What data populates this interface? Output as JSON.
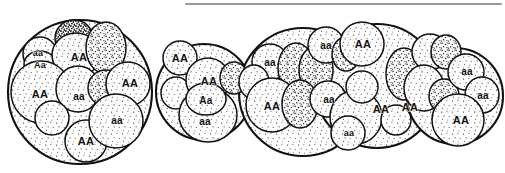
{
  "figure": {
    "background_color": "#ffffff",
    "ink_color": "#111111",
    "stipple_color": "#2a2a2a",
    "rule": {
      "name": "top-horizontal-rule",
      "color": "#9a9a9a",
      "x1": 186,
      "x2": 501,
      "y": 4,
      "thickness": 2
    },
    "populations": [
      {
        "id": "population-1",
        "cx": 80,
        "cy": 92,
        "r": 72,
        "fill": "light-stipple"
      },
      {
        "id": "population-2",
        "cx": 204,
        "cy": 92,
        "r": 48,
        "fill": "light-stipple"
      },
      {
        "id": "population-3",
        "cx": 303,
        "cy": 92,
        "r": 64,
        "fill": "light-stipple"
      },
      {
        "id": "population-4",
        "cx": 377,
        "cy": 86,
        "r": 62,
        "fill": "light-stipple"
      },
      {
        "id": "population-5",
        "cx": 455,
        "cy": 96,
        "r": 48,
        "fill": "light-stipple"
      }
    ],
    "cells": [
      {
        "id": "c1-1",
        "cx": 40,
        "cy": 54,
        "rx": 17,
        "ry": 17,
        "shade": "light"
      },
      {
        "id": "c1-2",
        "cx": 40,
        "cy": 64,
        "rx": 16,
        "ry": 13,
        "shade": "light"
      },
      {
        "id": "c1-3",
        "cx": 74,
        "cy": 38,
        "rx": 19,
        "ry": 18,
        "shade": "dark"
      },
      {
        "id": "c1-4",
        "cx": 76,
        "cy": 55,
        "rx": 24,
        "ry": 22,
        "shade": "light"
      },
      {
        "id": "c1-5",
        "cx": 106,
        "cy": 48,
        "rx": 20,
        "ry": 26,
        "shade": "medium"
      },
      {
        "id": "c1-6",
        "cx": 41,
        "cy": 92,
        "rx": 30,
        "ry": 31,
        "shade": "light"
      },
      {
        "id": "c1-7",
        "cx": 78,
        "cy": 89,
        "rx": 22,
        "ry": 23,
        "shade": "light"
      },
      {
        "id": "c1-8",
        "cx": 106,
        "cy": 88,
        "rx": 18,
        "ry": 18,
        "shade": "medium"
      },
      {
        "id": "c1-9",
        "cx": 128,
        "cy": 84,
        "rx": 22,
        "ry": 22,
        "shade": "light"
      },
      {
        "id": "c1-10",
        "cx": 52,
        "cy": 118,
        "rx": 17,
        "ry": 17,
        "shade": "light"
      },
      {
        "id": "c1-11",
        "cx": 86,
        "cy": 141,
        "rx": 21,
        "ry": 21,
        "shade": "light"
      },
      {
        "id": "c1-12",
        "cx": 116,
        "cy": 121,
        "rx": 27,
        "ry": 27,
        "shade": "light"
      },
      {
        "id": "c2-1",
        "cx": 180,
        "cy": 58,
        "rx": 17,
        "ry": 17,
        "shade": "light"
      },
      {
        "id": "c2-2",
        "cx": 176,
        "cy": 93,
        "rx": 15,
        "ry": 16,
        "shade": "light"
      },
      {
        "id": "c2-3",
        "cx": 208,
        "cy": 80,
        "rx": 22,
        "ry": 22,
        "shade": "light"
      },
      {
        "id": "c2-4",
        "cx": 234,
        "cy": 78,
        "rx": 14,
        "ry": 16,
        "shade": "medium"
      },
      {
        "id": "c2-5",
        "cx": 208,
        "cy": 115,
        "rx": 29,
        "ry": 27,
        "shade": "light"
      },
      {
        "id": "c2-6",
        "cx": 206,
        "cy": 99,
        "rx": 20,
        "ry": 16,
        "shade": "light"
      },
      {
        "id": "c3-1",
        "cx": 270,
        "cy": 62,
        "rx": 18,
        "ry": 18,
        "shade": "light"
      },
      {
        "id": "c3-2",
        "cx": 254,
        "cy": 82,
        "rx": 15,
        "ry": 17,
        "shade": "light"
      },
      {
        "id": "c3-3",
        "cx": 296,
        "cy": 68,
        "rx": 18,
        "ry": 25,
        "shade": "medium"
      },
      {
        "id": "c3-4",
        "cx": 316,
        "cy": 70,
        "rx": 17,
        "ry": 24,
        "shade": "medium"
      },
      {
        "id": "c3-5",
        "cx": 272,
        "cy": 105,
        "rx": 26,
        "ry": 27,
        "shade": "light"
      },
      {
        "id": "c3-6",
        "cx": 300,
        "cy": 104,
        "rx": 18,
        "ry": 24,
        "shade": "medium"
      },
      {
        "id": "c3-7",
        "cx": 328,
        "cy": 99,
        "rx": 18,
        "ry": 18,
        "shade": "light"
      },
      {
        "id": "c3-8",
        "cx": 326,
        "cy": 45,
        "rx": 18,
        "ry": 18,
        "shade": "light"
      },
      {
        "id": "c3-9",
        "cx": 346,
        "cy": 54,
        "rx": 14,
        "ry": 17,
        "shade": "medium"
      },
      {
        "id": "c3-10",
        "cx": 362,
        "cy": 44,
        "rx": 22,
        "ry": 22,
        "shade": "light"
      },
      {
        "id": "c3-11",
        "cx": 356,
        "cy": 117,
        "rx": 26,
        "ry": 27,
        "shade": "light"
      },
      {
        "id": "c3-12",
        "cx": 348,
        "cy": 133,
        "rx": 17,
        "ry": 17,
        "shade": "light"
      },
      {
        "id": "c3-13",
        "cx": 362,
        "cy": 87,
        "rx": 16,
        "ry": 16,
        "shade": "light"
      },
      {
        "id": "c4-1",
        "cx": 404,
        "cy": 74,
        "rx": 18,
        "ry": 26,
        "shade": "medium"
      },
      {
        "id": "c4-2",
        "cx": 396,
        "cy": 120,
        "rx": 15,
        "ry": 15,
        "shade": "light"
      },
      {
        "id": "c4-3",
        "cx": 430,
        "cy": 52,
        "rx": 18,
        "ry": 18,
        "shade": "light"
      },
      {
        "id": "c4-4",
        "cx": 446,
        "cy": 52,
        "rx": 15,
        "ry": 17,
        "shade": "medium"
      },
      {
        "id": "c4-5",
        "cx": 424,
        "cy": 88,
        "rx": 20,
        "ry": 23,
        "shade": "light"
      },
      {
        "id": "c4-6",
        "cx": 444,
        "cy": 96,
        "rx": 15,
        "ry": 17,
        "shade": "medium"
      },
      {
        "id": "c4-7",
        "cx": 466,
        "cy": 72,
        "rx": 18,
        "ry": 18,
        "shade": "light"
      },
      {
        "id": "c4-8",
        "cx": 482,
        "cy": 95,
        "rx": 17,
        "ry": 18,
        "shade": "light"
      },
      {
        "id": "c4-9",
        "cx": 458,
        "cy": 120,
        "rx": 26,
        "ry": 26,
        "shade": "light"
      }
    ],
    "labels": [
      {
        "id": "lbl-1",
        "text": "aa",
        "x": 38,
        "y": 54,
        "size": 9
      },
      {
        "id": "lbl-2",
        "text": "Aa",
        "x": 40,
        "y": 66,
        "size": 9
      },
      {
        "id": "lbl-3",
        "text": "AA",
        "x": 79,
        "y": 58,
        "size": 11
      },
      {
        "id": "lbl-4",
        "text": "AA",
        "x": 40,
        "y": 95,
        "size": 11
      },
      {
        "id": "lbl-5",
        "text": "aa",
        "x": 79,
        "y": 97,
        "size": 10
      },
      {
        "id": "lbl-6",
        "text": "AA",
        "x": 130,
        "y": 84,
        "size": 11
      },
      {
        "id": "lbl-7",
        "text": "aa",
        "x": 117,
        "y": 121,
        "size": 10
      },
      {
        "id": "lbl-8",
        "text": "AA",
        "x": 86,
        "y": 142,
        "size": 11
      },
      {
        "id": "lbl-9",
        "text": "AA",
        "x": 180,
        "y": 59,
        "size": 11
      },
      {
        "id": "lbl-10",
        "text": "AA",
        "x": 209,
        "y": 82,
        "size": 11
      },
      {
        "id": "lbl-11",
        "text": "Aa",
        "x": 206,
        "y": 101,
        "size": 10
      },
      {
        "id": "lbl-12",
        "text": "aa",
        "x": 205,
        "y": 122,
        "size": 10
      },
      {
        "id": "lbl-13",
        "text": "aa",
        "x": 270,
        "y": 63,
        "size": 10
      },
      {
        "id": "lbl-14",
        "text": "AA",
        "x": 272,
        "y": 107,
        "size": 11
      },
      {
        "id": "lbl-15",
        "text": "aa",
        "x": 329,
        "y": 100,
        "size": 10
      },
      {
        "id": "lbl-16",
        "text": "aa",
        "x": 326,
        "y": 46,
        "size": 10
      },
      {
        "id": "lbl-17",
        "text": "AA",
        "x": 363,
        "y": 45,
        "size": 11
      },
      {
        "id": "lbl-18",
        "text": "aa",
        "x": 349,
        "y": 134,
        "size": 9
      },
      {
        "id": "lbl-19",
        "text": "AA",
        "x": 381,
        "y": 110,
        "size": 11
      },
      {
        "id": "lbl-20",
        "text": "AA",
        "x": 410,
        "y": 108,
        "size": 11
      },
      {
        "id": "lbl-21",
        "text": "aa",
        "x": 467,
        "y": 72,
        "size": 10
      },
      {
        "id": "lbl-22",
        "text": "aa",
        "x": 483,
        "y": 96,
        "size": 10
      },
      {
        "id": "lbl-23",
        "text": "AA",
        "x": 461,
        "y": 121,
        "size": 11
      }
    ]
  }
}
